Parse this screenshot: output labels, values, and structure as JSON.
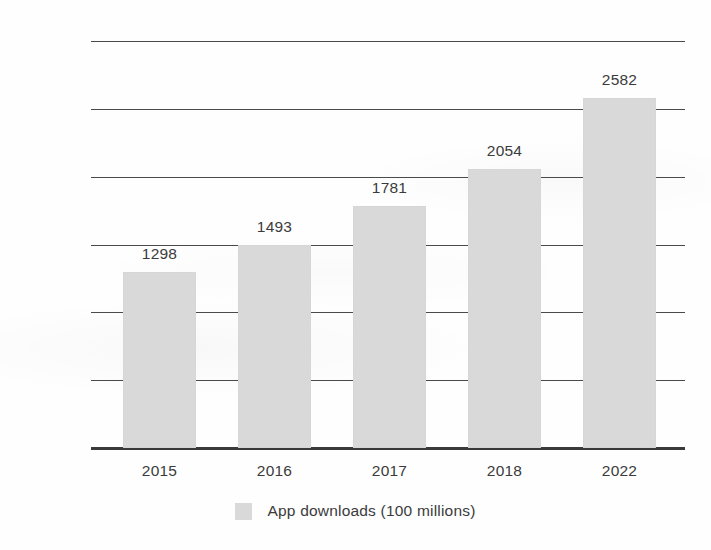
{
  "chart_data": {
    "type": "bar",
    "title": "",
    "subtitle": "",
    "xlabel": "",
    "ylabel": "",
    "categories": [
      "2015",
      "2016",
      "2017",
      "2018",
      "2022"
    ],
    "values": [
      1298,
      1493,
      1781,
      2054,
      2582
    ],
    "data_labels": [
      "1298",
      "1493",
      "1781",
      "2054",
      "2582"
    ],
    "series": [
      {
        "name": "App downloads (100 millions)",
        "values": [
          1298,
          1493,
          1781,
          2054,
          2582
        ],
        "color": "#d9d9d9"
      }
    ],
    "ylim": [
      0,
      3000
    ],
    "ytick_values": [
      0,
      500,
      1000,
      1500,
      2000,
      2500,
      3000
    ],
    "ytick_labels": [
      "0",
      "500",
      "1000",
      "1500",
      "2000",
      "2500",
      "3000"
    ],
    "grid": true,
    "grid_axis": "y",
    "legend": {
      "position": "bottom",
      "entries": [
        {
          "label": "App downloads (100 millions)",
          "color": "#d9d9d9"
        }
      ]
    },
    "annotations": [],
    "colors": {
      "bar_fill": "#d9d9d9",
      "gridline": "#4a4a4a",
      "axis": "#3a3a3a",
      "text": "#3b3b3b",
      "background": "#fefefe"
    }
  }
}
